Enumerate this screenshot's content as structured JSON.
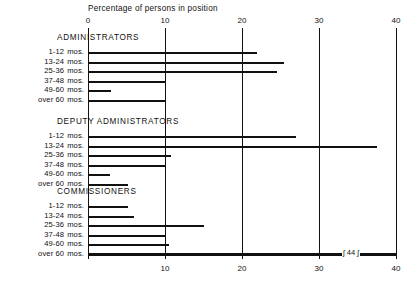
{
  "chart_data": {
    "type": "bar",
    "orientation": "horizontal",
    "title": "Percentage of persons in position",
    "xlabel": "Percentage of persons in position",
    "ylabel": "",
    "xlim": [
      0,
      40
    ],
    "xticks": [
      0,
      10,
      20,
      30,
      40
    ],
    "xtick_labels": [
      "0",
      "10",
      "20",
      "30",
      "40"
    ],
    "grid": true,
    "legend": "none",
    "axis_top_labels": [
      "0",
      "10",
      "20",
      "30",
      "40"
    ],
    "axis_bottom_labels": [
      "10",
      "20",
      "30",
      "40"
    ],
    "categories": [
      "1-12 mos.",
      "13-24 mos.",
      "25-36 mos.",
      "37-48 mos.",
      "49-60 mos.",
      "over 60 mos."
    ],
    "groups": [
      {
        "name": "ADMINISTRATORS",
        "values": [
          22.0,
          25.5,
          24.5,
          10.0,
          3.0,
          10.0
        ]
      },
      {
        "name": "DEPUTY ADMINISTRATORS",
        "values": [
          27.0,
          37.5,
          10.8,
          10.0,
          2.8,
          5.2
        ]
      },
      {
        "name": "COMMISSIONERS",
        "values": [
          5.2,
          6.0,
          15.0,
          10.0,
          10.5,
          44.0
        ]
      }
    ],
    "annotations": [
      {
        "text": "44",
        "group": "COMMISSIONERS",
        "category": "over 60 mos.",
        "note": "axis-break marker on truncated bar"
      }
    ]
  },
  "labels": {
    "axis_title": "Percentage of persons in position",
    "break_value": "44"
  }
}
